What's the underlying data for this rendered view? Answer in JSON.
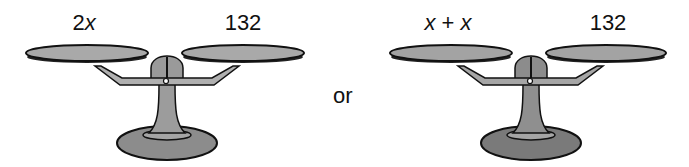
{
  "diagram": {
    "connector_word": "or",
    "scales": [
      {
        "id": "left-scale",
        "left_pan_label": {
          "prefix": "2",
          "variable": "x",
          "suffix": ""
        },
        "left_pan_text": "2x",
        "right_pan_label": "132",
        "balanced": true
      },
      {
        "id": "right-scale",
        "left_pan_label": {
          "prefix": "",
          "variable": "x",
          "suffix": " + x"
        },
        "left_pan_text": "x + x",
        "right_pan_label": "132",
        "balanced": true
      }
    ],
    "colors": {
      "pan_fill": "#a9a9a9",
      "pan_outline": "#111111",
      "base_fill": "#8c8c8c",
      "base_fill_dark": "#7a7a7a",
      "beam_fill": "#b0b0b0",
      "text": "#111111",
      "background": "#ffffff"
    }
  }
}
